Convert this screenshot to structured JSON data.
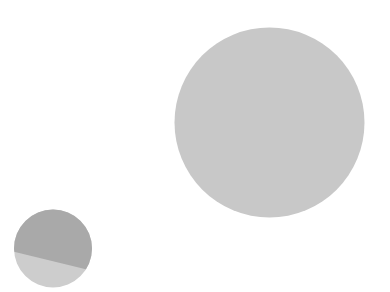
{
  "chart_data": [
    {
      "type": "pie",
      "title": "",
      "description": "Large single-value circle",
      "center": [
        269.5,
        122.5
      ],
      "radius": 95,
      "series": [
        {
          "name": "segment-1",
          "value": 100,
          "color": "#c8c8c8"
        }
      ]
    },
    {
      "type": "pie",
      "title": "",
      "description": "Small circle divided by a slanted chord into two filled segments",
      "center": [
        53,
        248.5
      ],
      "radius": 39,
      "chord": {
        "from": [
          15,
          252
        ],
        "to": [
          91,
          270.5
        ]
      },
      "series": [
        {
          "name": "upper-segment",
          "value": 70,
          "color": "#a9a9a9"
        },
        {
          "name": "lower-segment",
          "value": 30,
          "color": "#cdcdcd"
        }
      ]
    }
  ],
  "colors": {
    "background": "#ffffff",
    "large_circle": "#c8c8c8",
    "small_upper": "#a9a9a9",
    "small_lower": "#cdcdcd"
  }
}
